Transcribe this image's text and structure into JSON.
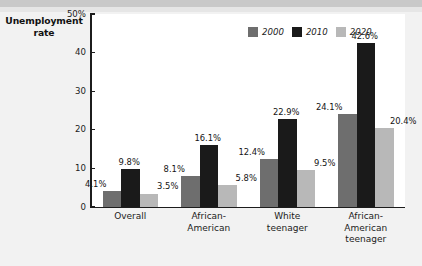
{
  "chart_data": {
    "type": "bar",
    "title": "",
    "subtitle": "",
    "xlabel": "",
    "ylabel": "Unemployment rate",
    "ylim": [
      0,
      50
    ],
    "yticks": [
      0,
      10,
      20,
      30,
      40,
      50
    ],
    "ytick_labels": [
      "0",
      "10",
      "20",
      "30",
      "40",
      "50%"
    ],
    "grid": false,
    "legend_position": "top-right",
    "categories": [
      "Overall",
      "African-American",
      "White teenager",
      "African-American teenager"
    ],
    "category_lines": [
      [
        "Overall"
      ],
      [
        "African-",
        "American"
      ],
      [
        "White",
        "teenager"
      ],
      [
        "African-",
        "American",
        "teenager"
      ]
    ],
    "series": [
      {
        "name": "2000",
        "color": "#6e6e6e",
        "values": [
          4.1,
          8.1,
          12.4,
          24.1
        ],
        "labels": [
          "4.1%",
          "8.1%",
          "12.4%",
          "24.1%"
        ]
      },
      {
        "name": "2010",
        "color": "#1a1a1a",
        "values": [
          9.8,
          16.1,
          22.9,
          42.6
        ],
        "labels": [
          "9.8%",
          "16.1%",
          "22.9%",
          "42.6%"
        ]
      },
      {
        "name": "2020",
        "color": "#b8b8b8",
        "values": [
          3.5,
          5.8,
          9.5,
          20.4
        ],
        "labels": [
          "3.5%",
          "5.8%",
          "9.5%",
          "20.4%"
        ]
      }
    ]
  },
  "axis": {
    "y_title_line1": "Unemployment",
    "y_title_line2": "rate"
  },
  "colors": {
    "page_background": "#f2f2f2",
    "plot_background": "#ffffff",
    "axis": "#1c1c1c",
    "top_band": "#c9c9c9",
    "series_2000": "#6e6e6e",
    "series_2010": "#1a1a1a",
    "series_2020": "#b8b8b8"
  }
}
